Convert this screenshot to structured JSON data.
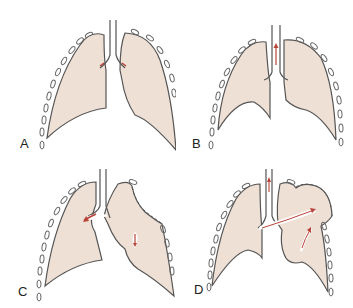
{
  "figure": {
    "colors": {
      "lung_fill": "#efe0d6",
      "outline": "#555555",
      "arrow": "#b8443a",
      "background": "#ffffff"
    },
    "panels": [
      {
        "label": "A",
        "description": "normal lungs, inward airflow arrows at bronchi"
      },
      {
        "label": "B",
        "description": "lungs with upward airflow arrow in trachea"
      },
      {
        "label": "C",
        "description": "right lung collapsed with dashed pleura, arrow into left bronchus"
      },
      {
        "label": "D",
        "description": "right lung expanded with dashed pleura, arrow across to right lung"
      }
    ]
  }
}
